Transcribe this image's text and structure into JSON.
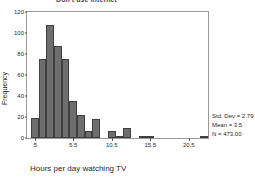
{
  "chart_data": {
    "type": "bar",
    "title": "Don't use Internet",
    "xlabel": "Hours per day watching TV",
    "ylabel": "Frequency",
    "xlim": [
      -0.5,
      23.0
    ],
    "ylim": [
      0,
      120
    ],
    "grid": false,
    "legend": null,
    "bin_width": 1,
    "x_ticks": [
      ".5",
      "5.5",
      "10.5",
      "15.5",
      "20.5"
    ],
    "x_tick_values": [
      0.5,
      5.5,
      10.5,
      15.5,
      20.5
    ],
    "y_ticks": [
      "0",
      "20",
      "40",
      "60",
      "80",
      "100",
      "120"
    ],
    "y_tick_values": [
      0,
      20,
      40,
      60,
      80,
      100,
      120
    ],
    "x": [
      0.5,
      1.5,
      2.5,
      3.5,
      4.5,
      5.5,
      6.5,
      7.5,
      8.5,
      9.5,
      10.5,
      11.5,
      12.5,
      13.5,
      14.5,
      15.5,
      16.5,
      22.5
    ],
    "values": [
      19,
      75,
      108,
      88,
      75,
      35,
      22,
      7,
      18,
      0,
      7,
      2,
      10,
      0,
      2,
      1,
      0,
      1
    ],
    "bars": [
      {
        "bin": ".5",
        "x": 0.5,
        "value": 19
      },
      {
        "bin": "1.5",
        "x": 1.5,
        "value": 75
      },
      {
        "bin": "2.5",
        "x": 2.5,
        "value": 108
      },
      {
        "bin": "3.5",
        "x": 3.5,
        "value": 88
      },
      {
        "bin": "4.5",
        "x": 4.5,
        "value": 75
      },
      {
        "bin": "5.5",
        "x": 5.5,
        "value": 35
      },
      {
        "bin": "6.5",
        "x": 6.5,
        "value": 22
      },
      {
        "bin": "7.5",
        "x": 7.5,
        "value": 7
      },
      {
        "bin": "8.5",
        "x": 8.5,
        "value": 18
      },
      {
        "bin": "9.5",
        "x": 9.5,
        "value": 0
      },
      {
        "bin": "10.5",
        "x": 10.5,
        "value": 7
      },
      {
        "bin": "11.5",
        "x": 11.5,
        "value": 2
      },
      {
        "bin": "12.5",
        "x": 12.5,
        "value": 10
      },
      {
        "bin": "13.5",
        "x": 13.5,
        "value": 0
      },
      {
        "bin": "14.5",
        "x": 14.5,
        "value": 2
      },
      {
        "bin": "15.5",
        "x": 15.5,
        "value": 1
      },
      {
        "bin": "16.5",
        "x": 16.5,
        "value": 0
      },
      {
        "bin": "22.5",
        "x": 22.5,
        "value": 1
      }
    ],
    "bar_color": "#6e6e6e",
    "bar_edge_color": "#3f3f3f"
  },
  "stats": {
    "std_dev": "Std. Dev = 2.79",
    "mean": "Mean = 3.5",
    "n": "N = 473.00"
  }
}
